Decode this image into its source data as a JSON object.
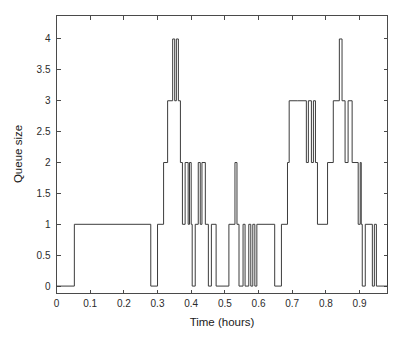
{
  "figure": {
    "background_color": "#ffffff",
    "line_color": "#3c3c3c",
    "axis_color": "#4a4a4a"
  },
  "chart_data": {
    "type": "line",
    "drawstyle": "steps-post",
    "title": "",
    "subtitle": "",
    "xlabel": "Time (hours)",
    "ylabel": "Queue size",
    "xlim": [
      0,
      0.983
    ],
    "ylim": [
      -0.12,
      4.38
    ],
    "grid": false,
    "legend": null,
    "annotations": [],
    "xticks": [
      0,
      0.1,
      0.2,
      0.3,
      0.4,
      0.5,
      0.6,
      0.7,
      0.8,
      0.9
    ],
    "xticklabels": [
      "0",
      "0.1",
      "0.2",
      "0.3",
      "0.4",
      "0.5",
      "0.6",
      "0.7",
      "0.8",
      "0.9"
    ],
    "yticks": [
      0,
      0.5,
      1,
      1.5,
      2,
      2.5,
      3,
      3.5,
      4
    ],
    "yticklabels": [
      "0",
      "0.5",
      "1",
      "1.5",
      "2",
      "2.5",
      "3",
      "3.5",
      "4"
    ],
    "series": [
      {
        "name": "Queue size",
        "color": "#3c3c3c",
        "x": [
          0.0,
          0.053,
          0.28,
          0.3,
          0.318,
          0.33,
          0.345,
          0.351,
          0.356,
          0.362,
          0.368,
          0.374,
          0.382,
          0.391,
          0.395,
          0.4,
          0.403,
          0.412,
          0.421,
          0.427,
          0.432,
          0.442,
          0.451,
          0.46,
          0.474,
          0.512,
          0.53,
          0.536,
          0.542,
          0.554,
          0.56,
          0.571,
          0.577,
          0.583,
          0.589,
          0.595,
          0.648,
          0.668,
          0.686,
          0.691,
          0.715,
          0.742,
          0.748,
          0.757,
          0.763,
          0.769,
          0.775,
          0.805,
          0.822,
          0.84,
          0.848,
          0.857,
          0.866,
          0.878,
          0.896,
          0.902,
          0.905,
          0.908,
          0.917,
          0.938,
          0.944,
          0.95,
          0.983
        ],
        "y": [
          0,
          1,
          0,
          1,
          2,
          3,
          4,
          3,
          4,
          3,
          2,
          1,
          2,
          1,
          2,
          1,
          0,
          1,
          2,
          1,
          2,
          1,
          0,
          1,
          0,
          1,
          2,
          1,
          0,
          1,
          0,
          1,
          0,
          1,
          0,
          1,
          0,
          1,
          2,
          3,
          3,
          2,
          3,
          2,
          3,
          2,
          1,
          2,
          3,
          4,
          3,
          2,
          3,
          2,
          1,
          2,
          1,
          0,
          1,
          0,
          1,
          0,
          1
        ]
      }
    ]
  },
  "axes": {
    "x_title": "Time (hours)",
    "y_title": "Queue size"
  }
}
